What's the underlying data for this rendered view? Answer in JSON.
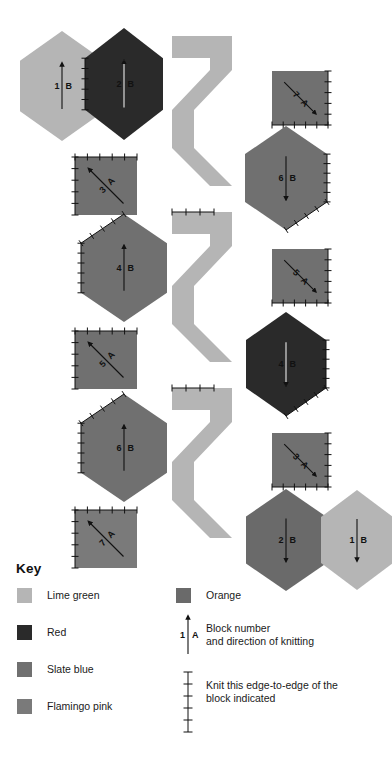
{
  "diagram": {
    "palette": {
      "lime_green": "#b5b5b5",
      "red": "#2a2a2a",
      "slate_blue": "#707070",
      "flamingo_pink": "#7a7a7a",
      "orange": "#6a6a6a",
      "background": "#ffffff",
      "ink": "#111111"
    },
    "left_column": [
      {
        "id": "L1",
        "number": "1",
        "letter": "B",
        "shape": "hexagon",
        "color_name": "lime_green",
        "color": "#b5b5b5",
        "arrow": "up",
        "ticks": "none"
      },
      {
        "id": "L2",
        "number": "2",
        "letter": "B",
        "shape": "hexagon",
        "color_name": "red",
        "color": "#2a2a2a",
        "arrow": "up",
        "ticks": "left"
      },
      {
        "id": "L3",
        "number": "3",
        "letter": "A",
        "shape": "square",
        "color_name": "slate_blue",
        "color": "#707070",
        "arrow": "up-left",
        "ticks": "top-left"
      },
      {
        "id": "L4",
        "number": "4",
        "letter": "B",
        "shape": "hexagon",
        "color_name": "slate_blue",
        "color": "#707070",
        "arrow": "up",
        "ticks": "top-left"
      },
      {
        "id": "L5",
        "number": "5",
        "letter": "A",
        "shape": "square",
        "color_name": "slate_blue",
        "color": "#707070",
        "arrow": "up-left",
        "ticks": "top-left"
      },
      {
        "id": "L6",
        "number": "6",
        "letter": "B",
        "shape": "hexagon",
        "color_name": "slate_blue",
        "color": "#707070",
        "arrow": "up",
        "ticks": "top-left"
      },
      {
        "id": "L7",
        "number": "7",
        "letter": "A",
        "shape": "square",
        "color_name": "flamingo_pink",
        "color": "#7a7a7a",
        "arrow": "up-left",
        "ticks": "top-left"
      }
    ],
    "right_column": [
      {
        "id": "R7",
        "number": "7",
        "letter": "A",
        "shape": "square",
        "color_name": "slate_blue",
        "color": "#707070",
        "arrow": "down-right",
        "ticks": "right-bottom"
      },
      {
        "id": "R6",
        "number": "6",
        "letter": "B",
        "shape": "hexagon",
        "color_name": "slate_blue",
        "color": "#707070",
        "arrow": "down",
        "ticks": "right-bottom"
      },
      {
        "id": "R5",
        "number": "5",
        "letter": "A",
        "shape": "square",
        "color_name": "slate_blue",
        "color": "#707070",
        "arrow": "down-right",
        "ticks": "right-bottom"
      },
      {
        "id": "R4",
        "number": "4",
        "letter": "B",
        "shape": "hexagon",
        "color_name": "red",
        "color": "#2a2a2a",
        "arrow": "down",
        "ticks": "right-bottom"
      },
      {
        "id": "R3",
        "number": "3",
        "letter": "A",
        "shape": "square",
        "color_name": "slate_blue",
        "color": "#707070",
        "arrow": "down-right",
        "ticks": "right-bottom"
      },
      {
        "id": "R2",
        "number": "2",
        "letter": "B",
        "shape": "hexagon",
        "color_name": "orange",
        "color": "#6a6a6a",
        "arrow": "down",
        "ticks": "right"
      },
      {
        "id": "R1",
        "number": "1",
        "letter": "B",
        "shape": "hexagon",
        "color_name": "lime_green",
        "color": "#b5b5b5",
        "arrow": "down",
        "ticks": "none"
      }
    ],
    "center_strips": [
      {
        "id": "Z1",
        "color_name": "lime_green",
        "color": "#b5b5b5",
        "ticks": "none"
      },
      {
        "id": "Z2",
        "color_name": "lime_green",
        "color": "#b5b5b5",
        "ticks": "top"
      },
      {
        "id": "Z3",
        "color_name": "lime_green",
        "color": "#b5b5b5",
        "ticks": "top"
      }
    ]
  },
  "key": {
    "heading": "Key",
    "swatches": [
      {
        "label": "Lime green",
        "color": "#b5b5b5"
      },
      {
        "label": "Red",
        "color": "#2a2a2a"
      },
      {
        "label": "Slate blue",
        "color": "#707070"
      },
      {
        "label": "Flamingo pink",
        "color": "#7a7a7a"
      },
      {
        "label": "Orange",
        "color": "#6a6a6a"
      }
    ],
    "arrow_entry": {
      "number": "1",
      "letter": "A",
      "line1": "Block number",
      "line2": "and direction of knitting"
    },
    "tick_entry": {
      "line1": "Knit this edge-to-edge of the",
      "line2": "block indicated"
    }
  }
}
